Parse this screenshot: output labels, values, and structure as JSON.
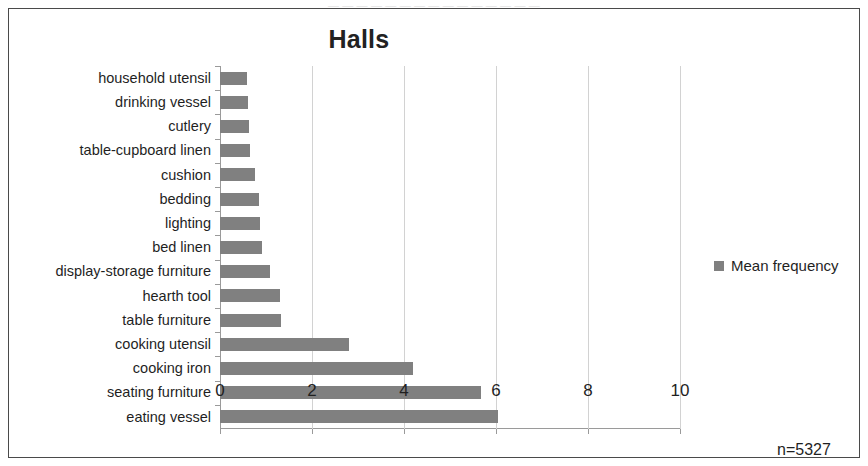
{
  "page_artifact_text": "— — — — — — — — — — — — — — —",
  "chart": {
    "title": "Halls",
    "legend": {
      "position": "right",
      "entries": [
        {
          "label": "Mean frequency",
          "color": "#808080",
          "marker": "square"
        }
      ]
    },
    "annotation": "n=5327",
    "axis": {
      "x_tick_labels": [
        "0",
        "2",
        "4",
        "6",
        "8",
        "10"
      ]
    }
  },
  "chart_data": {
    "type": "bar",
    "orientation": "horizontal",
    "title": "Halls",
    "xlabel": "",
    "ylabel": "",
    "xlim": [
      0,
      10
    ],
    "xticks": [
      0,
      2,
      4,
      6,
      8,
      10
    ],
    "grid": "vertical",
    "legend_position": "right",
    "annotations": [
      "n=5327"
    ],
    "series": [
      {
        "name": "Mean frequency",
        "color": "#808080",
        "values": [
          0.59,
          0.6,
          0.63,
          0.65,
          0.76,
          0.85,
          0.87,
          0.91,
          1.09,
          1.3,
          1.33,
          2.8,
          4.2,
          5.67,
          6.04
        ]
      }
    ],
    "categories": [
      "household utensil",
      "drinking vessel",
      "cutlery",
      "table-cupboard linen",
      "cushion",
      "bedding",
      "lighting",
      "bed linen",
      "display-storage furniture",
      "hearth tool",
      "table furniture",
      "cooking utensil",
      "cooking iron",
      "seating furniture",
      "eating vessel"
    ]
  }
}
